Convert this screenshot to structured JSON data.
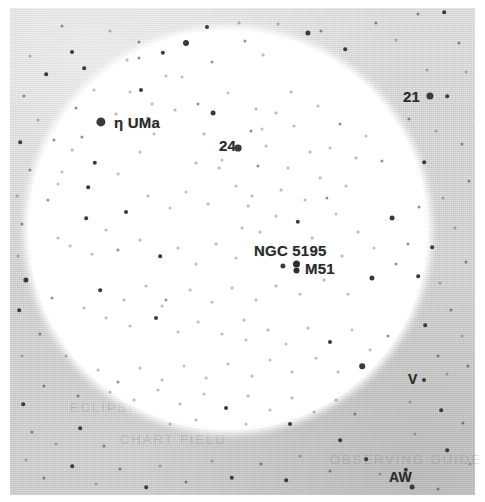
{
  "figure": {
    "kind": "star-chart",
    "colors": {
      "paper": "#ffffff",
      "sky_field": "#d2d2d2",
      "star_ink": "#3a3a3a",
      "label_ink": "#2b2b2b",
      "fov_fill": "#ffffff"
    }
  },
  "field_of_view": {
    "cx": 228,
    "cy": 230,
    "r": 200,
    "shape": "circle"
  },
  "labels": [
    {
      "id": "eta-uma",
      "text": "η UMa",
      "x": 114,
      "y": 122,
      "size": 15,
      "anchor": "left"
    },
    {
      "id": "star-24",
      "text": "24",
      "x": 219,
      "y": 145,
      "size": 15,
      "anchor": "left"
    },
    {
      "id": "star-21",
      "text": "21",
      "x": 403,
      "y": 96,
      "size": 15,
      "anchor": "left"
    },
    {
      "id": "ngc-5195",
      "text": "NGC 5195",
      "x": 254,
      "y": 250,
      "size": 15,
      "anchor": "left"
    },
    {
      "id": "m51",
      "text": "M51",
      "x": 305,
      "y": 268,
      "size": 15,
      "anchor": "left"
    },
    {
      "id": "var-v",
      "text": "V",
      "x": 408,
      "y": 379,
      "size": 14,
      "anchor": "left"
    },
    {
      "id": "var-aw",
      "text": "AW",
      "x": 389,
      "y": 477,
      "size": 14,
      "anchor": "left"
    }
  ],
  "ghost_text": [
    {
      "text": "ECLIPSING BINARY",
      "x": 70,
      "y": 400,
      "size": 13
    },
    {
      "text": "CHART FIELD",
      "x": 120,
      "y": 432,
      "size": 13
    },
    {
      "text": "OBSERVING GUIDE",
      "x": 330,
      "y": 452,
      "size": 13
    }
  ],
  "deep_sky_objects": [
    {
      "id": "m51-glyph",
      "name": "M51",
      "x": 296,
      "y": 267,
      "symbol": "galaxy-double-lobe"
    }
  ],
  "stars": [
    {
      "x": 101,
      "y": 122,
      "r": 4.6
    },
    {
      "x": 238,
      "y": 148,
      "r": 3.4
    },
    {
      "x": 430,
      "y": 96,
      "r": 3.6
    },
    {
      "x": 283,
      "y": 266,
      "r": 2.6
    },
    {
      "x": 62,
      "y": 26,
      "r": 1.6,
      "c": "soft"
    },
    {
      "x": 72,
      "y": 52,
      "r": 2.0
    },
    {
      "x": 110,
      "y": 31,
      "r": 1.5,
      "c": "faint"
    },
    {
      "x": 139,
      "y": 42,
      "r": 1.6,
      "c": "soft"
    },
    {
      "x": 163,
      "y": 53,
      "r": 2.2
    },
    {
      "x": 186,
      "y": 43,
      "r": 3.0
    },
    {
      "x": 207,
      "y": 27,
      "r": 2.0
    },
    {
      "x": 212,
      "y": 62,
      "r": 1.6,
      "c": "soft"
    },
    {
      "x": 182,
      "y": 77,
      "r": 1.5,
      "c": "faint"
    },
    {
      "x": 239,
      "y": 23,
      "r": 1.4,
      "c": "faint"
    },
    {
      "x": 263,
      "y": 55,
      "r": 1.4,
      "c": "faint"
    },
    {
      "x": 245,
      "y": 41,
      "r": 1.6,
      "c": "soft"
    },
    {
      "x": 278,
      "y": 24,
      "r": 1.5,
      "c": "faint"
    },
    {
      "x": 308,
      "y": 33,
      "r": 2.6
    },
    {
      "x": 321,
      "y": 31,
      "r": 1.6,
      "c": "soft"
    },
    {
      "x": 345,
      "y": 49,
      "r": 1.8
    },
    {
      "x": 376,
      "y": 23,
      "r": 1.6,
      "c": "soft"
    },
    {
      "x": 396,
      "y": 40,
      "r": 1.5,
      "c": "faint"
    },
    {
      "x": 418,
      "y": 14,
      "r": 1.6,
      "c": "soft"
    },
    {
      "x": 444,
      "y": 12,
      "r": 1.8
    },
    {
      "x": 459,
      "y": 43,
      "r": 1.6,
      "c": "soft"
    },
    {
      "x": 447,
      "y": 96,
      "r": 1.8
    },
    {
      "x": 427,
      "y": 70,
      "r": 1.5,
      "c": "faint"
    },
    {
      "x": 466,
      "y": 72,
      "r": 1.5,
      "c": "faint"
    },
    {
      "x": 409,
      "y": 119,
      "r": 1.6,
      "c": "soft"
    },
    {
      "x": 436,
      "y": 131,
      "r": 1.5,
      "c": "faint"
    },
    {
      "x": 462,
      "y": 144,
      "r": 1.6,
      "c": "soft"
    },
    {
      "x": 424,
      "y": 162,
      "r": 1.8
    },
    {
      "x": 469,
      "y": 181,
      "r": 1.6,
      "c": "soft"
    },
    {
      "x": 443,
      "y": 198,
      "r": 1.5,
      "c": "faint"
    },
    {
      "x": 419,
      "y": 207,
      "r": 1.6,
      "c": "soft"
    },
    {
      "x": 455,
      "y": 228,
      "r": 1.5,
      "c": "faint"
    },
    {
      "x": 432,
      "y": 247,
      "r": 1.8
    },
    {
      "x": 466,
      "y": 262,
      "r": 1.6,
      "c": "soft"
    },
    {
      "x": 440,
      "y": 283,
      "r": 1.5,
      "c": "faint"
    },
    {
      "x": 418,
      "y": 276,
      "r": 1.8
    },
    {
      "x": 451,
      "y": 310,
      "r": 1.6,
      "c": "soft"
    },
    {
      "x": 425,
      "y": 325,
      "r": 1.8
    },
    {
      "x": 462,
      "y": 336,
      "r": 1.5,
      "c": "faint"
    },
    {
      "x": 438,
      "y": 356,
      "r": 1.6,
      "c": "soft"
    },
    {
      "x": 424,
      "y": 380,
      "r": 2.0
    },
    {
      "x": 447,
      "y": 374,
      "r": 1.5,
      "c": "faint"
    },
    {
      "x": 468,
      "y": 366,
      "r": 1.6,
      "c": "soft"
    },
    {
      "x": 410,
      "y": 402,
      "r": 1.5,
      "c": "faint"
    },
    {
      "x": 441,
      "y": 410,
      "r": 1.8
    },
    {
      "x": 463,
      "y": 423,
      "r": 1.6,
      "c": "soft"
    },
    {
      "x": 415,
      "y": 434,
      "r": 1.5,
      "c": "faint"
    },
    {
      "x": 447,
      "y": 450,
      "r": 1.8
    },
    {
      "x": 470,
      "y": 464,
      "r": 1.5,
      "c": "faint"
    },
    {
      "x": 406,
      "y": 470,
      "r": 2.2
    },
    {
      "x": 412,
      "y": 487,
      "r": 2.4
    },
    {
      "x": 438,
      "y": 489,
      "r": 1.6,
      "c": "soft"
    },
    {
      "x": 380,
      "y": 474,
      "r": 1.5,
      "c": "faint"
    },
    {
      "x": 366,
      "y": 459,
      "r": 1.8
    },
    {
      "x": 340,
      "y": 440,
      "r": 1.8
    },
    {
      "x": 355,
      "y": 414,
      "r": 1.6,
      "c": "soft"
    },
    {
      "x": 330,
      "y": 471,
      "r": 1.6,
      "c": "soft"
    },
    {
      "x": 300,
      "y": 456,
      "r": 1.5,
      "c": "faint"
    },
    {
      "x": 286,
      "y": 480,
      "r": 1.8
    },
    {
      "x": 261,
      "y": 464,
      "r": 1.6,
      "c": "soft"
    },
    {
      "x": 232,
      "y": 478,
      "r": 2.2
    },
    {
      "x": 212,
      "y": 461,
      "r": 1.5,
      "c": "faint"
    },
    {
      "x": 186,
      "y": 482,
      "r": 1.6,
      "c": "soft"
    },
    {
      "x": 160,
      "y": 466,
      "r": 1.5,
      "c": "faint"
    },
    {
      "x": 146,
      "y": 487,
      "r": 1.8
    },
    {
      "x": 120,
      "y": 469,
      "r": 1.6,
      "c": "soft"
    },
    {
      "x": 96,
      "y": 484,
      "r": 1.5,
      "c": "faint"
    },
    {
      "x": 72,
      "y": 466,
      "r": 1.8
    },
    {
      "x": 44,
      "y": 478,
      "r": 1.6,
      "c": "soft"
    },
    {
      "x": 26,
      "y": 460,
      "r": 1.5,
      "c": "faint"
    },
    {
      "x": 32,
      "y": 432,
      "r": 1.6,
      "c": "soft"
    },
    {
      "x": 56,
      "y": 444,
      "r": 1.5,
      "c": "faint"
    },
    {
      "x": 80,
      "y": 428,
      "r": 1.8
    },
    {
      "x": 104,
      "y": 446,
      "r": 1.6,
      "c": "soft"
    },
    {
      "x": 23,
      "y": 404,
      "r": 1.8
    },
    {
      "x": 44,
      "y": 386,
      "r": 1.6,
      "c": "soft"
    },
    {
      "x": 22,
      "y": 356,
      "r": 1.5,
      "c": "faint"
    },
    {
      "x": 40,
      "y": 334,
      "r": 1.6,
      "c": "soft"
    },
    {
      "x": 19,
      "y": 310,
      "r": 1.8
    },
    {
      "x": 26,
      "y": 280,
      "r": 2.6
    },
    {
      "x": 18,
      "y": 256,
      "r": 1.5,
      "c": "faint"
    },
    {
      "x": 22,
      "y": 224,
      "r": 1.6,
      "c": "soft"
    },
    {
      "x": 17,
      "y": 196,
      "r": 1.5,
      "c": "faint"
    },
    {
      "x": 30,
      "y": 170,
      "r": 1.6,
      "c": "soft"
    },
    {
      "x": 20,
      "y": 142,
      "r": 1.8
    },
    {
      "x": 38,
      "y": 120,
      "r": 1.5,
      "c": "faint"
    },
    {
      "x": 24,
      "y": 96,
      "r": 1.6,
      "c": "soft"
    },
    {
      "x": 46,
      "y": 74,
      "r": 1.8
    },
    {
      "x": 30,
      "y": 56,
      "r": 1.5,
      "c": "faint"
    },
    {
      "x": 54,
      "y": 140,
      "r": 1.6,
      "c": "soft"
    },
    {
      "x": 62,
      "y": 172,
      "r": 1.5,
      "c": "faint"
    },
    {
      "x": 48,
      "y": 200,
      "r": 1.6,
      "c": "soft"
    },
    {
      "x": 58,
      "y": 238,
      "r": 1.5,
      "c": "faint"
    },
    {
      "x": 52,
      "y": 298,
      "r": 1.6,
      "c": "soft"
    },
    {
      "x": 66,
      "y": 356,
      "r": 1.5,
      "c": "faint"
    },
    {
      "x": 78,
      "y": 396,
      "r": 1.6,
      "c": "soft"
    },
    {
      "x": 94,
      "y": 90,
      "r": 1.5,
      "c": "faint"
    },
    {
      "x": 76,
      "y": 108,
      "r": 1.6,
      "c": "soft"
    },
    {
      "x": 84,
      "y": 68,
      "r": 1.8
    },
    {
      "x": 130,
      "y": 92,
      "r": 1.5,
      "c": "faint"
    },
    {
      "x": 139,
      "y": 58,
      "r": 1.6,
      "c": "soft"
    },
    {
      "x": 82,
      "y": 137,
      "r": 1.6,
      "c": "soft"
    },
    {
      "x": 72,
      "y": 150,
      "r": 1.4,
      "c": "faint"
    },
    {
      "x": 95,
      "y": 163,
      "r": 2.2
    },
    {
      "x": 58,
      "y": 184,
      "r": 1.5,
      "c": "faint"
    },
    {
      "x": 88,
      "y": 187,
      "r": 1.8
    },
    {
      "x": 118,
      "y": 174,
      "r": 1.4,
      "c": "faint"
    },
    {
      "x": 140,
      "y": 152,
      "r": 1.5,
      "c": "faint"
    },
    {
      "x": 148,
      "y": 118,
      "r": 1.6,
      "c": "soft"
    },
    {
      "x": 152,
      "y": 104,
      "r": 1.4,
      "c": "faint"
    },
    {
      "x": 141,
      "y": 90,
      "r": 2.0
    },
    {
      "x": 166,
      "y": 76,
      "r": 1.5,
      "c": "faint"
    },
    {
      "x": 175,
      "y": 110,
      "r": 1.4,
      "c": "faint"
    },
    {
      "x": 198,
      "y": 104,
      "r": 1.6,
      "c": "soft"
    },
    {
      "x": 213,
      "y": 113,
      "r": 2.4
    },
    {
      "x": 228,
      "y": 93,
      "r": 1.5,
      "c": "faint"
    },
    {
      "x": 256,
      "y": 109,
      "r": 1.4,
      "c": "faint"
    },
    {
      "x": 262,
      "y": 129,
      "r": 1.5,
      "c": "faint"
    },
    {
      "x": 276,
      "y": 113,
      "r": 1.4,
      "c": "faint"
    },
    {
      "x": 251,
      "y": 131,
      "r": 1.6,
      "c": "soft"
    },
    {
      "x": 294,
      "y": 126,
      "r": 1.5,
      "c": "faint"
    },
    {
      "x": 291,
      "y": 92,
      "r": 1.4,
      "c": "faint"
    },
    {
      "x": 318,
      "y": 106,
      "r": 1.5,
      "c": "faint"
    },
    {
      "x": 340,
      "y": 124,
      "r": 1.6,
      "c": "soft"
    },
    {
      "x": 330,
      "y": 148,
      "r": 1.5,
      "c": "faint"
    },
    {
      "x": 356,
      "y": 158,
      "r": 1.4,
      "c": "faint"
    },
    {
      "x": 366,
      "y": 136,
      "r": 1.5,
      "c": "faint"
    },
    {
      "x": 382,
      "y": 161,
      "r": 1.6,
      "c": "soft"
    },
    {
      "x": 346,
      "y": 186,
      "r": 1.5,
      "c": "faint"
    },
    {
      "x": 320,
      "y": 178,
      "r": 1.4,
      "c": "faint"
    },
    {
      "x": 305,
      "y": 200,
      "r": 1.5,
      "c": "faint"
    },
    {
      "x": 281,
      "y": 190,
      "r": 1.4,
      "c": "faint"
    },
    {
      "x": 258,
      "y": 166,
      "r": 1.6,
      "c": "soft"
    },
    {
      "x": 236,
      "y": 186,
      "r": 1.5,
      "c": "faint"
    },
    {
      "x": 248,
      "y": 206,
      "r": 1.4,
      "c": "faint"
    },
    {
      "x": 252,
      "y": 196,
      "r": 1.4,
      "c": "faint"
    },
    {
      "x": 222,
      "y": 160,
      "r": 1.5,
      "c": "faint"
    },
    {
      "x": 196,
      "y": 163,
      "r": 1.4,
      "c": "faint"
    },
    {
      "x": 186,
      "y": 192,
      "r": 1.5,
      "c": "faint"
    },
    {
      "x": 208,
      "y": 204,
      "r": 1.4,
      "c": "faint"
    },
    {
      "x": 170,
      "y": 208,
      "r": 1.5,
      "c": "faint"
    },
    {
      "x": 148,
      "y": 196,
      "r": 1.4,
      "c": "faint"
    },
    {
      "x": 126,
      "y": 212,
      "r": 2.0
    },
    {
      "x": 106,
      "y": 230,
      "r": 1.5,
      "c": "faint"
    },
    {
      "x": 86,
      "y": 218,
      "r": 1.8
    },
    {
      "x": 70,
      "y": 246,
      "r": 1.4,
      "c": "faint"
    },
    {
      "x": 92,
      "y": 254,
      "r": 1.5,
      "c": "faint"
    },
    {
      "x": 118,
      "y": 250,
      "r": 1.6,
      "c": "soft"
    },
    {
      "x": 140,
      "y": 240,
      "r": 1.4,
      "c": "faint"
    },
    {
      "x": 160,
      "y": 256,
      "r": 1.8
    },
    {
      "x": 178,
      "y": 248,
      "r": 1.4,
      "c": "faint"
    },
    {
      "x": 196,
      "y": 264,
      "r": 1.5,
      "c": "faint"
    },
    {
      "x": 216,
      "y": 244,
      "r": 1.4,
      "c": "faint"
    },
    {
      "x": 236,
      "y": 258,
      "r": 1.5,
      "c": "faint"
    },
    {
      "x": 260,
      "y": 232,
      "r": 1.4,
      "c": "faint"
    },
    {
      "x": 276,
      "y": 216,
      "r": 1.5,
      "c": "faint"
    },
    {
      "x": 298,
      "y": 222,
      "r": 2.2
    },
    {
      "x": 312,
      "y": 238,
      "r": 1.4,
      "c": "faint"
    },
    {
      "x": 336,
      "y": 214,
      "r": 1.5,
      "c": "faint"
    },
    {
      "x": 358,
      "y": 232,
      "r": 1.4,
      "c": "faint"
    },
    {
      "x": 374,
      "y": 248,
      "r": 1.5,
      "c": "faint"
    },
    {
      "x": 392,
      "y": 218,
      "r": 2.4
    },
    {
      "x": 396,
      "y": 264,
      "r": 1.6,
      "c": "soft"
    },
    {
      "x": 372,
      "y": 278,
      "r": 2.6
    },
    {
      "x": 348,
      "y": 294,
      "r": 1.5,
      "c": "faint"
    },
    {
      "x": 324,
      "y": 280,
      "r": 1.4,
      "c": "faint"
    },
    {
      "x": 300,
      "y": 294,
      "r": 1.5,
      "c": "faint"
    },
    {
      "x": 276,
      "y": 286,
      "r": 1.4,
      "c": "faint"
    },
    {
      "x": 256,
      "y": 300,
      "r": 1.5,
      "c": "faint"
    },
    {
      "x": 232,
      "y": 288,
      "r": 1.4,
      "c": "faint"
    },
    {
      "x": 212,
      "y": 302,
      "r": 1.5,
      "c": "faint"
    },
    {
      "x": 190,
      "y": 290,
      "r": 1.4,
      "c": "faint"
    },
    {
      "x": 166,
      "y": 300,
      "r": 1.6,
      "c": "soft"
    },
    {
      "x": 146,
      "y": 286,
      "r": 1.5,
      "c": "faint"
    },
    {
      "x": 124,
      "y": 300,
      "r": 1.4,
      "c": "faint"
    },
    {
      "x": 100,
      "y": 290,
      "r": 1.8
    },
    {
      "x": 84,
      "y": 308,
      "r": 1.5,
      "c": "faint"
    },
    {
      "x": 106,
      "y": 318,
      "r": 1.4,
      "c": "faint"
    },
    {
      "x": 130,
      "y": 326,
      "r": 1.5,
      "c": "faint"
    },
    {
      "x": 156,
      "y": 318,
      "r": 2.0
    },
    {
      "x": 162,
      "y": 306,
      "r": 1.4,
      "c": "faint"
    },
    {
      "x": 178,
      "y": 332,
      "r": 1.5,
      "c": "faint"
    },
    {
      "x": 198,
      "y": 322,
      "r": 1.4,
      "c": "faint"
    },
    {
      "x": 222,
      "y": 334,
      "r": 1.5,
      "c": "faint"
    },
    {
      "x": 244,
      "y": 320,
      "r": 1.4,
      "c": "faint"
    },
    {
      "x": 246,
      "y": 340,
      "r": 1.5,
      "c": "faint"
    },
    {
      "x": 268,
      "y": 330,
      "r": 1.4,
      "c": "faint"
    },
    {
      "x": 286,
      "y": 344,
      "r": 1.5,
      "c": "faint"
    },
    {
      "x": 308,
      "y": 328,
      "r": 1.4,
      "c": "faint"
    },
    {
      "x": 330,
      "y": 342,
      "r": 2.0
    },
    {
      "x": 352,
      "y": 330,
      "r": 1.5,
      "c": "faint"
    },
    {
      "x": 370,
      "y": 350,
      "r": 1.4,
      "c": "faint"
    },
    {
      "x": 388,
      "y": 336,
      "r": 1.6,
      "c": "soft"
    },
    {
      "x": 362,
      "y": 366,
      "r": 2.8
    },
    {
      "x": 338,
      "y": 372,
      "r": 1.4,
      "c": "faint"
    },
    {
      "x": 316,
      "y": 358,
      "r": 1.5,
      "c": "faint"
    },
    {
      "x": 292,
      "y": 372,
      "r": 1.4,
      "c": "faint"
    },
    {
      "x": 270,
      "y": 360,
      "r": 1.5,
      "c": "faint"
    },
    {
      "x": 252,
      "y": 376,
      "r": 1.4,
      "c": "faint"
    },
    {
      "x": 228,
      "y": 364,
      "r": 1.5,
      "c": "faint"
    },
    {
      "x": 206,
      "y": 378,
      "r": 1.4,
      "c": "faint"
    },
    {
      "x": 184,
      "y": 366,
      "r": 1.5,
      "c": "faint"
    },
    {
      "x": 162,
      "y": 380,
      "r": 1.4,
      "c": "faint"
    },
    {
      "x": 140,
      "y": 368,
      "r": 1.5,
      "c": "faint"
    },
    {
      "x": 118,
      "y": 382,
      "r": 1.6,
      "c": "soft"
    },
    {
      "x": 98,
      "y": 370,
      "r": 1.4,
      "c": "faint"
    },
    {
      "x": 110,
      "y": 392,
      "r": 1.5,
      "c": "faint"
    },
    {
      "x": 134,
      "y": 400,
      "r": 1.4,
      "c": "faint"
    },
    {
      "x": 158,
      "y": 390,
      "r": 1.5,
      "c": "faint"
    },
    {
      "x": 180,
      "y": 404,
      "r": 1.4,
      "c": "faint"
    },
    {
      "x": 204,
      "y": 394,
      "r": 1.5,
      "c": "faint"
    },
    {
      "x": 226,
      "y": 408,
      "r": 2.0
    },
    {
      "x": 248,
      "y": 396,
      "r": 1.4,
      "c": "faint"
    },
    {
      "x": 270,
      "y": 410,
      "r": 1.5,
      "c": "faint"
    },
    {
      "x": 292,
      "y": 398,
      "r": 1.4,
      "c": "faint"
    },
    {
      "x": 314,
      "y": 412,
      "r": 1.5,
      "c": "faint"
    },
    {
      "x": 336,
      "y": 400,
      "r": 1.4,
      "c": "faint"
    },
    {
      "x": 246,
      "y": 424,
      "r": 1.5,
      "c": "faint"
    },
    {
      "x": 196,
      "y": 420,
      "r": 1.4,
      "c": "faint"
    },
    {
      "x": 290,
      "y": 424,
      "r": 2.0
    },
    {
      "x": 170,
      "y": 424,
      "r": 1.5,
      "c": "faint"
    },
    {
      "x": 116,
      "y": 114,
      "r": 1.4,
      "c": "faint"
    },
    {
      "x": 127,
      "y": 60,
      "r": 1.4,
      "c": "faint"
    },
    {
      "x": 154,
      "y": 134,
      "r": 1.5,
      "c": "faint"
    },
    {
      "x": 204,
      "y": 134,
      "r": 1.4,
      "c": "faint"
    },
    {
      "x": 219,
      "y": 168,
      "r": 1.4,
      "c": "faint"
    },
    {
      "x": 266,
      "y": 146,
      "r": 1.4,
      "c": "faint"
    },
    {
      "x": 288,
      "y": 168,
      "r": 1.5,
      "c": "faint"
    },
    {
      "x": 310,
      "y": 152,
      "r": 1.4,
      "c": "faint"
    },
    {
      "x": 327,
      "y": 198,
      "r": 1.6,
      "c": "soft"
    },
    {
      "x": 242,
      "y": 228,
      "r": 1.4,
      "c": "faint"
    },
    {
      "x": 262,
      "y": 250,
      "r": 1.4,
      "c": "faint"
    },
    {
      "x": 342,
      "y": 256,
      "r": 1.4,
      "c": "faint"
    },
    {
      "x": 408,
      "y": 244,
      "r": 1.6,
      "c": "soft"
    }
  ]
}
